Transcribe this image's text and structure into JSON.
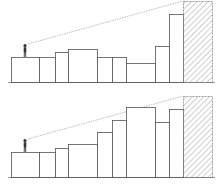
{
  "diagram": {
    "type": "line-of-sight-skyline",
    "colors": {
      "outline": "#555555",
      "sight_line": "#aaaaaa",
      "hatch": "#888888",
      "background": "#ffffff",
      "figure": "#333333"
    },
    "panels": [
      {
        "id": "top",
        "baseline_y": 82,
        "observer": {
          "x": 25,
          "feet_y": 57,
          "head_y": 44
        },
        "sight_line": {
          "x1": 28,
          "y1": 44,
          "x2": 183,
          "y2": 1
        },
        "buildings": [
          {
            "x0": 11,
            "x1": 39,
            "top": 57
          },
          {
            "x0": 39,
            "x1": 55,
            "top": 57
          },
          {
            "x0": 55,
            "x1": 68,
            "top": 52
          },
          {
            "x0": 68,
            "x1": 97,
            "top": 49
          },
          {
            "x0": 97,
            "x1": 112,
            "top": 57
          },
          {
            "x0": 112,
            "x1": 126,
            "top": 57
          },
          {
            "x0": 126,
            "x1": 155,
            "top": 63
          },
          {
            "x0": 155,
            "x1": 169,
            "top": 46
          },
          {
            "x0": 169,
            "x1": 183,
            "top": 14
          }
        ],
        "target": {
          "x0": 183,
          "x1": 212,
          "top": 1
        }
      },
      {
        "id": "bottom",
        "baseline_y": 177,
        "observer": {
          "x": 25,
          "feet_y": 152,
          "head_y": 139
        },
        "sight_line": {
          "x1": 28,
          "y1": 139,
          "x2": 183,
          "y2": 96
        },
        "buildings": [
          {
            "x0": 11,
            "x1": 39,
            "top": 152
          },
          {
            "x0": 39,
            "x1": 55,
            "top": 152
          },
          {
            "x0": 55,
            "x1": 68,
            "top": 148
          },
          {
            "x0": 68,
            "x1": 97,
            "top": 144
          },
          {
            "x0": 97,
            "x1": 112,
            "top": 132
          },
          {
            "x0": 112,
            "x1": 126,
            "top": 120
          },
          {
            "x0": 126,
            "x1": 155,
            "top": 107
          },
          {
            "x0": 155,
            "x1": 169,
            "top": 122
          },
          {
            "x0": 169,
            "x1": 183,
            "top": 109
          }
        ],
        "target": {
          "x0": 183,
          "x1": 212,
          "top": 96
        }
      }
    ]
  }
}
